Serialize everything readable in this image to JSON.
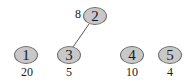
{
  "diagram": {
    "type": "graph",
    "node_fill": "#c8c8c8",
    "node_stroke": "#6e6e6e",
    "edge_color": "#555555",
    "nodes": [
      {
        "id": "1",
        "label": "1",
        "weight": "20",
        "x": 26,
        "y": 55,
        "weight_x": 27,
        "weight_y": 72
      },
      {
        "id": "2",
        "label": "2",
        "weight": "8",
        "x": 95,
        "y": 16,
        "weight_x": 78,
        "weight_y": 14
      },
      {
        "id": "3",
        "label": "3",
        "weight": "5",
        "x": 69,
        "y": 55,
        "weight_x": 69,
        "weight_y": 72
      },
      {
        "id": "4",
        "label": "4",
        "weight": "10",
        "x": 132,
        "y": 55,
        "weight_x": 132,
        "weight_y": 72
      },
      {
        "id": "5",
        "label": "5",
        "weight": "4",
        "x": 170,
        "y": 55,
        "weight_x": 170,
        "weight_y": 72
      }
    ],
    "edges": [
      {
        "from": "3",
        "to": "2",
        "x1": 73,
        "y1": 47,
        "x2": 89,
        "y2": 24
      }
    ]
  }
}
